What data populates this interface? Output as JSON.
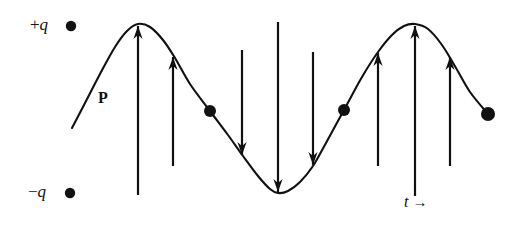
{
  "figure": {
    "background_color": "#ffffff",
    "stroke_color": "#111111",
    "width": 526,
    "height": 241
  },
  "labels": {
    "positive_charge": {
      "sign": "+",
      "symbol": "q",
      "text": "+q"
    },
    "negative_charge": {
      "sign": "−",
      "symbol": "q",
      "text": "−q"
    },
    "polarization_vector": "P",
    "time_axis": {
      "symbol": "t",
      "arrow": "→",
      "text": "t →"
    }
  },
  "chart_data": {
    "type": "line",
    "xlabel": "t",
    "ylabel": "P",
    "grid": false,
    "legend_position": "none",
    "axis_annotations": [
      {
        "name": "positive-charge-marker",
        "label": "+q",
        "x": 71,
        "y": 26
      },
      {
        "name": "negative-charge-marker",
        "label": "−q",
        "x": 70,
        "y": 193
      },
      {
        "name": "time-axis-marker",
        "label": "t →",
        "x": 404,
        "y": 202
      }
    ],
    "baseline_y": 109,
    "amplitude": 85,
    "peak_y": 24,
    "trough_y": 194,
    "curve_points": [
      {
        "x": 72,
        "y": 128
      },
      {
        "x": 85,
        "y": 103
      },
      {
        "x": 100,
        "y": 74
      },
      {
        "x": 115,
        "y": 47
      },
      {
        "x": 127,
        "y": 31
      },
      {
        "x": 138,
        "y": 24
      },
      {
        "x": 150,
        "y": 27
      },
      {
        "x": 163,
        "y": 40
      },
      {
        "x": 175,
        "y": 58
      },
      {
        "x": 190,
        "y": 84
      },
      {
        "x": 210,
        "y": 111
      },
      {
        "x": 228,
        "y": 135
      },
      {
        "x": 243,
        "y": 156
      },
      {
        "x": 258,
        "y": 176
      },
      {
        "x": 270,
        "y": 189
      },
      {
        "x": 278,
        "y": 193
      },
      {
        "x": 288,
        "y": 191
      },
      {
        "x": 300,
        "y": 182
      },
      {
        "x": 313,
        "y": 166
      },
      {
        "x": 326,
        "y": 143
      },
      {
        "x": 344,
        "y": 110
      },
      {
        "x": 362,
        "y": 77
      },
      {
        "x": 378,
        "y": 52
      },
      {
        "x": 392,
        "y": 35
      },
      {
        "x": 404,
        "y": 26
      },
      {
        "x": 415,
        "y": 24
      },
      {
        "x": 428,
        "y": 29
      },
      {
        "x": 442,
        "y": 45
      },
      {
        "x": 456,
        "y": 68
      },
      {
        "x": 470,
        "y": 92
      },
      {
        "x": 488,
        "y": 114
      }
    ],
    "markers": [
      {
        "name": "zero-crossing-dot-1",
        "x": 210,
        "y": 111,
        "radius": 6
      },
      {
        "name": "zero-crossing-dot-2",
        "x": 344,
        "y": 110,
        "radius": 6
      },
      {
        "name": "curve-end-dot",
        "x": 488,
        "y": 114,
        "radius": 7
      }
    ],
    "arrows": [
      {
        "name": "arrow-up-1",
        "x": 138,
        "direction": "up",
        "tail_y": 195,
        "head_y": 26,
        "length": 169
      },
      {
        "name": "arrow-up-2",
        "x": 173,
        "direction": "up",
        "tail_y": 166,
        "head_y": 57,
        "length": 109
      },
      {
        "name": "arrow-down-1",
        "x": 242,
        "direction": "down",
        "tail_y": 50,
        "head_y": 155,
        "length": 105
      },
      {
        "name": "arrow-down-2",
        "x": 278,
        "direction": "down",
        "tail_y": 22,
        "head_y": 192,
        "length": 170
      },
      {
        "name": "arrow-down-3",
        "x": 313,
        "direction": "down",
        "tail_y": 52,
        "head_y": 165,
        "length": 113
      },
      {
        "name": "arrow-up-3",
        "x": 378,
        "direction": "up",
        "tail_y": 166,
        "head_y": 53,
        "length": 113
      },
      {
        "name": "arrow-up-4",
        "x": 415,
        "direction": "up",
        "tail_y": 196,
        "head_y": 26,
        "length": 170
      },
      {
        "name": "arrow-up-5",
        "x": 450,
        "direction": "up",
        "tail_y": 166,
        "head_y": 57,
        "length": 109
      }
    ]
  }
}
